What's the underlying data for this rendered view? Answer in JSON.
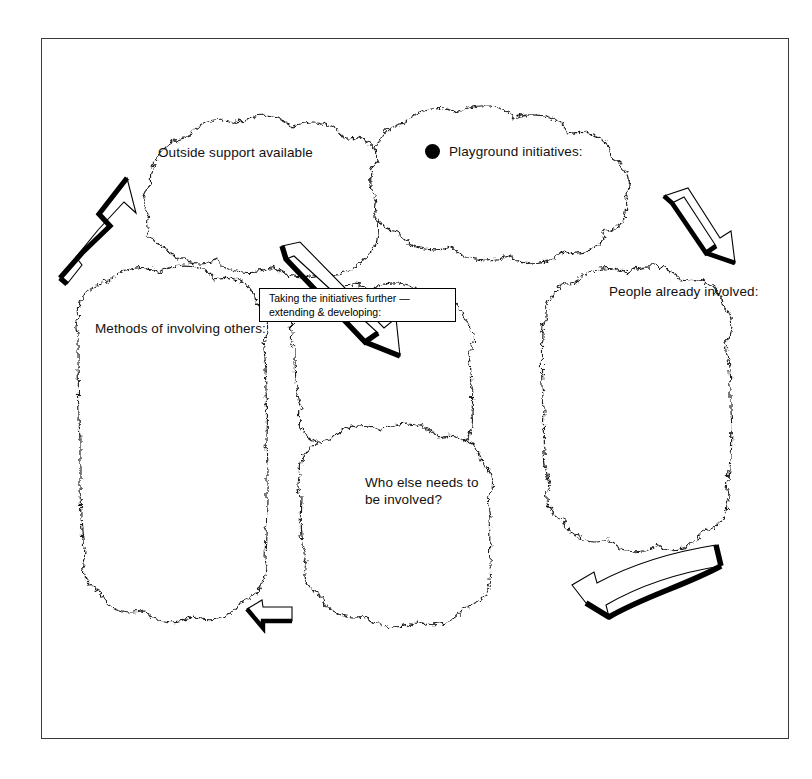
{
  "diagram": {
    "title_box": {
      "text": "Taking the initiatives further —\nextending & developing:"
    },
    "clouds": [
      {
        "id": "outside-support",
        "label": "Outside support available",
        "bullet": false
      },
      {
        "id": "playground-initiatives",
        "label": "Playground initiatives:",
        "bullet": true
      },
      {
        "id": "people-already-involved",
        "label": "People already involved:",
        "bullet": false
      },
      {
        "id": "methods-of-involving-others",
        "label": "Methods of involving others:",
        "bullet": false
      },
      {
        "id": "central-blank",
        "label": "",
        "bullet": false
      },
      {
        "id": "who-else-needs-to-be-involved",
        "label": "Who else needs to\nbe involved?",
        "bullet": false
      }
    ],
    "arrows": [
      {
        "id": "arrow-up-left",
        "direction": "up-right",
        "style": "straight-shadowed"
      },
      {
        "id": "arrow-down-right-top",
        "direction": "down-right",
        "style": "straight-shadowed"
      },
      {
        "id": "arrow-center-diagonal",
        "direction": "down-right",
        "style": "straight-shadowed"
      },
      {
        "id": "arrow-bottom-curved",
        "direction": "left",
        "style": "curved-shadowed"
      },
      {
        "id": "arrow-bottom-small",
        "direction": "left",
        "style": "straight-shadowed"
      }
    ],
    "colors": {
      "ink": "#000000",
      "frame": "#3a3a3a",
      "paper": "#ffffff"
    }
  }
}
